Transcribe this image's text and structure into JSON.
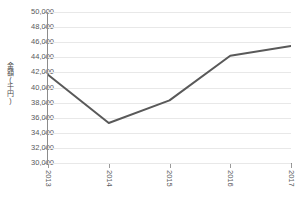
{
  "chart_data": {
    "type": "line",
    "title": "",
    "xlabel": "",
    "ylabel": "金額(千円)",
    "categories": [
      "2013",
      "2014",
      "2015",
      "2016",
      "2017"
    ],
    "values": [
      41700,
      35300,
      38300,
      44200,
      45500
    ],
    "series": [
      {
        "name": "金額(千円)",
        "values": [
          41700,
          35300,
          38300,
          44200,
          45500
        ]
      }
    ],
    "ylim": [
      30000,
      50000
    ],
    "ytick_step": 2000,
    "ytick_labels": [
      "50,000",
      "48,000",
      "46,000",
      "44,000",
      "42,000",
      "40,000",
      "38,000",
      "36,000",
      "34,000",
      "32,000",
      "30,000"
    ],
    "ytick_values": [
      50000,
      48000,
      46000,
      44000,
      42000,
      40000,
      38000,
      36000,
      34000,
      32000,
      30000
    ],
    "grid": true,
    "grid_axis": "y",
    "legend": false,
    "legend_position": "none",
    "markers": false,
    "colors": {
      "line": "#595959",
      "grid": "#e8e8e8",
      "axis": "#8c8c8c",
      "text": "#59595c",
      "background": "#ffffff"
    }
  }
}
